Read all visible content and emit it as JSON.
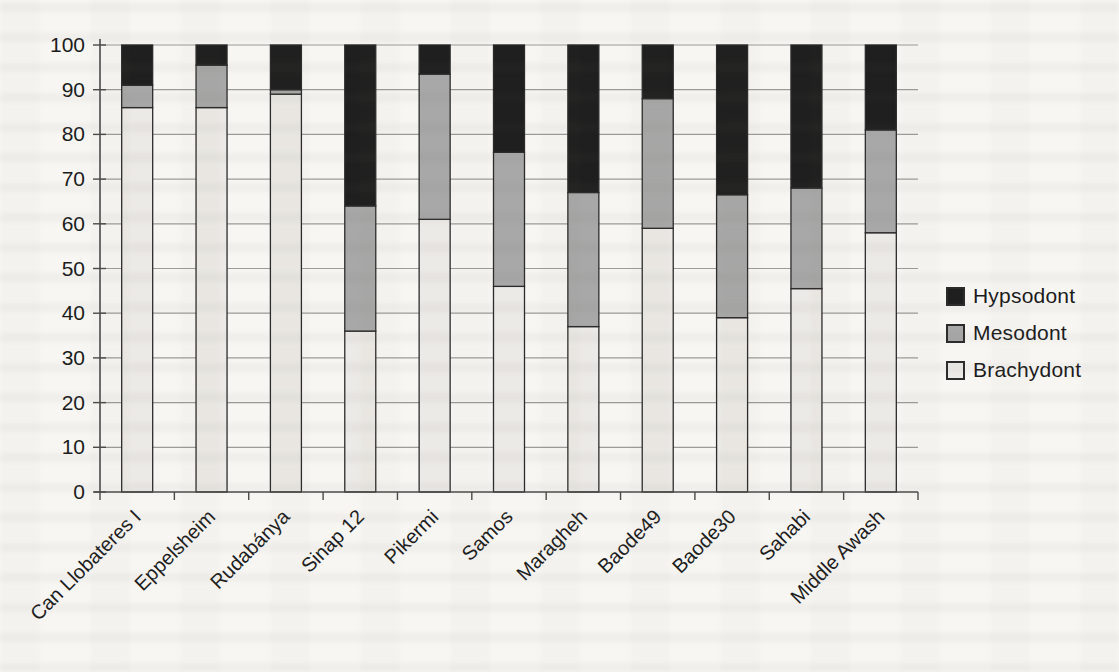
{
  "chart_data": {
    "type": "bar",
    "stacked": true,
    "percent_stacked": true,
    "title": "",
    "xlabel": "",
    "ylabel": "",
    "ylim": [
      0,
      100
    ],
    "ytick_step": 10,
    "yticks": [
      0,
      10,
      20,
      30,
      40,
      50,
      60,
      70,
      80,
      90,
      100
    ],
    "grid": "horizontal",
    "categories": [
      "Can Llobateres I",
      "Eppelsheim",
      "Rudabánya",
      "Sinap 12",
      "Pikermi",
      "Samos",
      "Maragheh",
      "Baode49",
      "Baode30",
      "Sahabi",
      "Middle Awash"
    ],
    "series": [
      {
        "name": "Brachydont",
        "color": "#eceae6",
        "values": [
          86,
          86,
          89,
          36,
          61,
          46,
          37,
          59,
          39,
          45.5,
          58
        ]
      },
      {
        "name": "Mesodont",
        "color": "#a8a8a8",
        "values": [
          5,
          9.5,
          1,
          28,
          32.5,
          30,
          30,
          29,
          27.5,
          22.5,
          23
        ]
      },
      {
        "name": "Hypsodont",
        "color": "#1f1f1f",
        "values": [
          9,
          4.5,
          10,
          36,
          6.5,
          24,
          33,
          12,
          33.5,
          32,
          19
        ]
      }
    ],
    "legend": {
      "position": "right",
      "entries": [
        {
          "label": "Hypsodont",
          "color": "#1f1f1f"
        },
        {
          "label": "Mesodont",
          "color": "#a8a8a8"
        },
        {
          "label": "Brachydont",
          "color": "#eceae6"
        }
      ]
    },
    "colors": {
      "gridline": "#9b9b98",
      "axis": "#4a4a48",
      "bar_border": "#2b2b2b",
      "text": "#1c1c1c"
    }
  }
}
